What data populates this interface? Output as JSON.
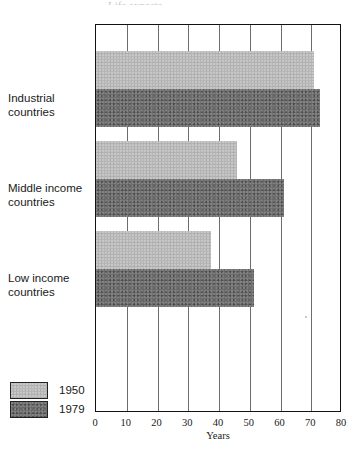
{
  "title_fragment": "Life expectancy",
  "chart_data": {
    "type": "bar",
    "orientation": "horizontal",
    "title": "",
    "xlabel": "Years",
    "ylabel": "",
    "xlim": [
      0,
      80
    ],
    "xticks": [
      0,
      10,
      20,
      30,
      40,
      50,
      60,
      70,
      80
    ],
    "grid": true,
    "legend_position": "bottom-left",
    "categories": [
      "Industrial countries",
      "Middle income countries",
      "Low income countries"
    ],
    "series": [
      {
        "name": "1950",
        "color": "#b5b5b5",
        "values": [
          71,
          46,
          37.5
        ]
      },
      {
        "name": "1979",
        "color": "#6e6e6e",
        "values": [
          73,
          61,
          51.5
        ]
      }
    ]
  },
  "categories": [
    {
      "line1": "Industrial",
      "line2": "countries"
    },
    {
      "line1": "Middle income",
      "line2": "countries"
    },
    {
      "line1": "Low income",
      "line2": "countries"
    }
  ],
  "axis": {
    "ticks": [
      "0",
      "10",
      "20",
      "30",
      "40",
      "50",
      "60",
      "70",
      "80"
    ],
    "title": "Years"
  },
  "legend": [
    {
      "label": "1950",
      "swatch": "legend-swatch-1950"
    },
    {
      "label": "1979",
      "swatch": "legend-swatch-1979"
    }
  ]
}
